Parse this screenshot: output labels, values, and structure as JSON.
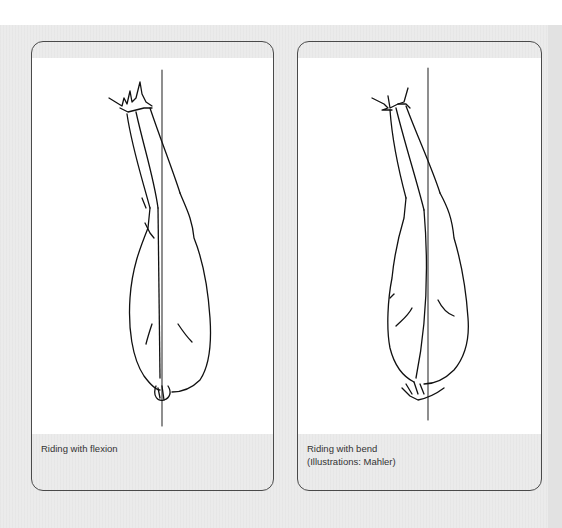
{
  "page": {
    "background_color": "#ebebeb",
    "panel_border_color": "#4a4a4a"
  },
  "figures": [
    {
      "id": "flexion",
      "illustration": "horse-top-view-flexion",
      "caption_lines": [
        "Riding with flexion"
      ]
    },
    {
      "id": "bend",
      "illustration": "horse-top-view-bend",
      "caption_lines": [
        "Riding with bend",
        "(Illustrations: Mahler)"
      ]
    }
  ]
}
